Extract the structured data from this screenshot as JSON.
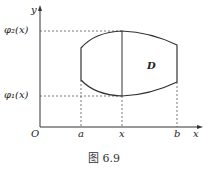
{
  "diagram": {
    "caption": "图 6.9",
    "labels": {
      "y_axis": "y",
      "x_axis": "x",
      "origin": "O",
      "a": "a",
      "x": "x",
      "b": "b",
      "region": "D",
      "phi2": "φ₂(x)",
      "phi1": "φ₁(x)"
    },
    "colors": {
      "stroke": "#333333",
      "background": "#ffffff"
    }
  }
}
